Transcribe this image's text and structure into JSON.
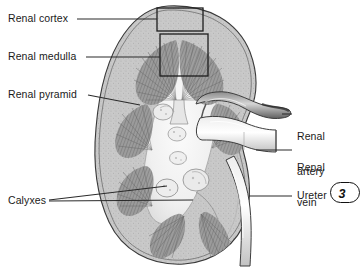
{
  "figure": {
    "page_number": "3",
    "colors": {
      "background": "#ffffff",
      "ink": "#1a1a1a",
      "leader_line": "#2b2b2b",
      "tissue_light": "#d8d8d8",
      "tissue_mid": "#b0b0b0",
      "tissue_dark": "#7a7a7a",
      "pyramid": "#8e8e8e",
      "sinus": "#f2f2f2"
    }
  },
  "labels": {
    "renal_cortex": "Renal cortex",
    "renal_medulla": "Renal medulla",
    "renal_pyramid": "Renal pyramid",
    "calyxes": "Calyxes",
    "renal_artery_line1": "Renal",
    "renal_artery_line2": "artery",
    "renal_vein_line1": "Renal",
    "renal_vein_line2": "vein",
    "ureter": "Ureter"
  },
  "structures": [
    {
      "name": "renal-cortex",
      "label": "Renal cortex",
      "side": "left",
      "callout": "box"
    },
    {
      "name": "renal-medulla",
      "label": "Renal medulla",
      "side": "left",
      "callout": "box"
    },
    {
      "name": "renal-pyramid",
      "label": "Renal pyramid",
      "side": "left",
      "callout": "line"
    },
    {
      "name": "calyxes",
      "label": "Calyxes",
      "side": "left",
      "callout": "double-line"
    },
    {
      "name": "renal-artery",
      "label": "Renal artery",
      "side": "right",
      "callout": "line"
    },
    {
      "name": "renal-vein",
      "label": "Renal vein",
      "side": "right",
      "callout": "line"
    },
    {
      "name": "ureter",
      "label": "Ureter",
      "side": "right",
      "callout": "line"
    }
  ]
}
